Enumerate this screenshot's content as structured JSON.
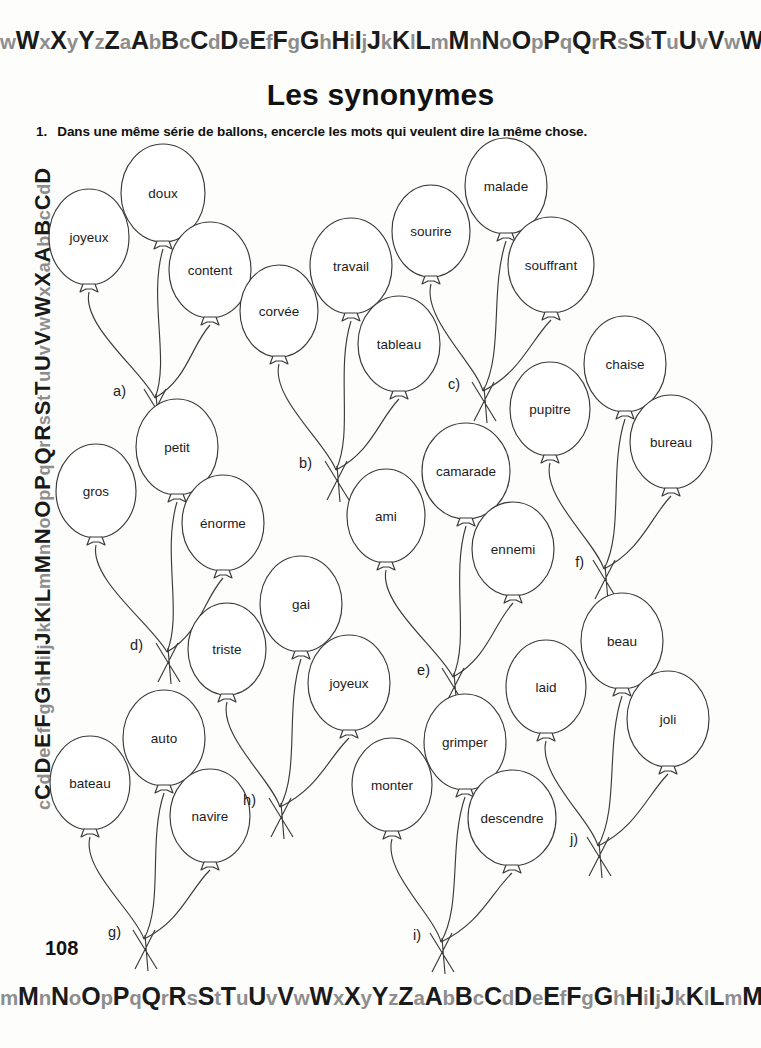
{
  "page": {
    "title": "Les synonymes",
    "page_number": "108",
    "background_color": "#fdfdfc",
    "ink_color": "#3a3a3a"
  },
  "instruction": {
    "number": "1.",
    "text": "Dans une même série de ballons, encercle les mots qui veulent dire la même chose."
  },
  "decorative_border": {
    "top_sequence": "wWxXyYzZaAbBcCdDeEfFgGhHiIjJkKlLmMnNoOpPqQrRsStTuUvVwWxXyYzZ",
    "bottom_sequence": "mMnNoOpPqQrRsStTuUvVwWxXyYzZaAbBcCdDeEfFgGhHiIjJkKlLmMnNoOpPqQ",
    "left_sequence": "cCdDeEfFgGhHiIjJkKlLmMnNoOpPqQrRsStTuUvVwWxXaAbBcCdD",
    "right_sequence": "zZfFgGhHiIjJkKlLmMnNoOpPqQrRsStTuUvVwWxXaAbBcCdDeEfFgGhHiIjJkKlLmMnNoOpPqQrRsStTuU",
    "uppercase_color": "#1a1a1a",
    "lowercase_color": "#8d8d8d"
  },
  "balloon_groups": [
    {
      "label": "a)",
      "label_x": 126,
      "label_y": 391,
      "tie_x": 155,
      "tie_y": 398,
      "balloons": [
        {
          "word": "joyeux",
          "cx": 89,
          "cy": 237,
          "rx": 40,
          "ry": 48
        },
        {
          "word": "doux",
          "cx": 163,
          "cy": 193,
          "rx": 42,
          "ry": 49
        },
        {
          "word": "content",
          "cx": 210,
          "cy": 270,
          "rx": 41,
          "ry": 48
        }
      ]
    },
    {
      "label": "b)",
      "label_x": 312,
      "label_y": 463,
      "tie_x": 336,
      "tie_y": 470,
      "balloons": [
        {
          "word": "corvée",
          "cx": 279,
          "cy": 311,
          "rx": 39,
          "ry": 46
        },
        {
          "word": "travail",
          "cx": 351,
          "cy": 266,
          "rx": 41,
          "ry": 48
        },
        {
          "word": "tableau",
          "cx": 399,
          "cy": 344,
          "rx": 41,
          "ry": 48
        }
      ]
    },
    {
      "label": "c)",
      "label_x": 460,
      "label_y": 384,
      "tie_x": 483,
      "tie_y": 391,
      "balloons": [
        {
          "word": "sourire",
          "cx": 431,
          "cy": 231,
          "rx": 39,
          "ry": 46
        },
        {
          "word": "malade",
          "cx": 506,
          "cy": 186,
          "rx": 41,
          "ry": 48
        },
        {
          "word": "souffrant",
          "cx": 551,
          "cy": 265,
          "rx": 43,
          "ry": 48
        }
      ]
    },
    {
      "label": "d)",
      "label_x": 143,
      "label_y": 645,
      "tie_x": 167,
      "tie_y": 652,
      "balloons": [
        {
          "word": "gros",
          "cx": 96,
          "cy": 491,
          "rx": 40,
          "ry": 47
        },
        {
          "word": "petit",
          "cx": 177,
          "cy": 447,
          "rx": 41,
          "ry": 48
        },
        {
          "word": "énorme",
          "cx": 223,
          "cy": 523,
          "rx": 41,
          "ry": 48
        }
      ]
    },
    {
      "label": "e)",
      "label_x": 430,
      "label_y": 670,
      "tie_x": 453,
      "tie_y": 677,
      "balloons": [
        {
          "word": "ami",
          "cx": 386,
          "cy": 516,
          "rx": 39,
          "ry": 47
        },
        {
          "word": "camarade",
          "cx": 466,
          "cy": 471,
          "rx": 44,
          "ry": 48
        },
        {
          "word": "ennemi",
          "cx": 513,
          "cy": 549,
          "rx": 41,
          "ry": 47
        }
      ]
    },
    {
      "label": "f)",
      "label_x": 584,
      "label_y": 562,
      "tie_x": 604,
      "tie_y": 569,
      "balloons": [
        {
          "word": "pupitre",
          "cx": 550,
          "cy": 409,
          "rx": 40,
          "ry": 47
        },
        {
          "word": "chaise",
          "cx": 625,
          "cy": 364,
          "rx": 41,
          "ry": 48
        },
        {
          "word": "bureau",
          "cx": 671,
          "cy": 442,
          "rx": 41,
          "ry": 47
        }
      ]
    },
    {
      "label": "g)",
      "label_x": 121,
      "label_y": 932,
      "tie_x": 144,
      "tie_y": 939,
      "balloons": [
        {
          "word": "bateau",
          "cx": 90,
          "cy": 783,
          "rx": 40,
          "ry": 47
        },
        {
          "word": "auto",
          "cx": 164,
          "cy": 738,
          "rx": 41,
          "ry": 48
        },
        {
          "word": "navire",
          "cx": 210,
          "cy": 816,
          "rx": 40,
          "ry": 47
        }
      ]
    },
    {
      "label": "h)",
      "label_x": 256,
      "label_y": 800,
      "tie_x": 280,
      "tie_y": 807,
      "balloons": [
        {
          "word": "triste",
          "cx": 227,
          "cy": 649,
          "rx": 39,
          "ry": 46
        },
        {
          "word": "gai",
          "cx": 301,
          "cy": 604,
          "rx": 41,
          "ry": 48
        },
        {
          "word": "joyeux",
          "cx": 349,
          "cy": 683,
          "rx": 41,
          "ry": 48
        }
      ]
    },
    {
      "label": "i)",
      "label_x": 421,
      "label_y": 935,
      "tie_x": 441,
      "tie_y": 942,
      "balloons": [
        {
          "word": "monter",
          "cx": 392,
          "cy": 785,
          "rx": 40,
          "ry": 47
        },
        {
          "word": "grimper",
          "cx": 465,
          "cy": 742,
          "rx": 41,
          "ry": 48
        },
        {
          "word": "descendre",
          "cx": 512,
          "cy": 818,
          "rx": 44,
          "ry": 48
        }
      ]
    },
    {
      "label": "j)",
      "label_x": 578,
      "label_y": 839,
      "tie_x": 598,
      "tie_y": 846,
      "balloons": [
        {
          "word": "laid",
          "cx": 546,
          "cy": 687,
          "rx": 40,
          "ry": 47
        },
        {
          "word": "beau",
          "cx": 622,
          "cy": 641,
          "rx": 41,
          "ry": 48
        },
        {
          "word": "joli",
          "cx": 668,
          "cy": 719,
          "rx": 41,
          "ry": 48
        }
      ]
    }
  ]
}
